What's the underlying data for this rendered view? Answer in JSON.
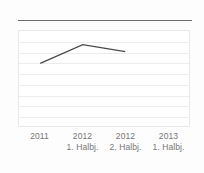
{
  "chart_data": {
    "type": "line",
    "title": "",
    "subtitle": "",
    "xlabel": "",
    "ylabel": "",
    "grid": true,
    "gridline_count": 8,
    "legend": "none",
    "categories": [
      "2011",
      "2012\n1. Halbj.",
      "2012\n2. Halbj.",
      "2013\n1. Halbj."
    ],
    "x": [
      "2011",
      "2012 1. Halbj.",
      "2012 2. Halbj.",
      "2013 1. Halbj."
    ],
    "series": [
      {
        "name": "Wert",
        "values": [
          6.4,
          8.3,
          7.6,
          null
        ],
        "color": "#4a4a4a"
      }
    ],
    "ylim": [
      0,
      9.7
    ],
    "xlim": [
      0,
      4
    ]
  },
  "axis": {
    "ticks": [
      {
        "year": "2011",
        "period": ""
      },
      {
        "year": "2012",
        "period": "1. Halbj."
      },
      {
        "year": "2012",
        "period": "2. Halbj."
      },
      {
        "year": "2013",
        "period": "1. Halbj."
      }
    ]
  },
  "style": {
    "line_color": "#4a4a4a",
    "grid_color": "#ececec",
    "panel_border": "#e9e9e9",
    "rule_color": "#6d6d6d",
    "label_color": "#767676",
    "background": "#fdfdfd"
  }
}
